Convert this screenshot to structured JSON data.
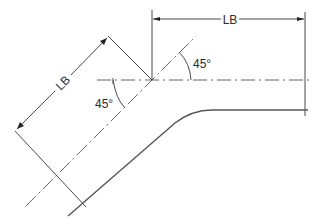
{
  "diagram": {
    "type": "pipe-bend-dimension-drawing",
    "labels": {
      "top_dimension": "LB",
      "diagonal_dimension": "LB",
      "angle_lower": "45°",
      "angle_upper": "45°"
    },
    "colors": {
      "line": "#4a4a4a",
      "text": "#2a2a2a",
      "background": "#ffffff"
    },
    "elements": [
      {
        "name": "horizontal-centerline",
        "style": "dash-dot"
      },
      {
        "name": "diagonal-centerline",
        "style": "dash-dot",
        "angle_deg": 45
      },
      {
        "name": "pipe-outline",
        "style": "solid",
        "shape": "bend"
      },
      {
        "name": "top-dimension-LB",
        "style": "dimension"
      },
      {
        "name": "diagonal-dimension-LB",
        "style": "dimension"
      },
      {
        "name": "angle-arc-lower-45",
        "style": "arc"
      },
      {
        "name": "angle-arc-upper-45",
        "style": "arc"
      }
    ]
  }
}
